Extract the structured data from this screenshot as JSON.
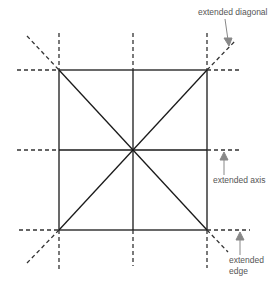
{
  "diagram": {
    "labels": {
      "diagonal": "extended diagonal",
      "axis": "extended axis",
      "edge_line1": "extended",
      "edge_line2": "edge"
    },
    "colors": {
      "line": "#1a1a1a",
      "dash": "#333333",
      "arrow": "#888888",
      "label": "#555555"
    }
  }
}
